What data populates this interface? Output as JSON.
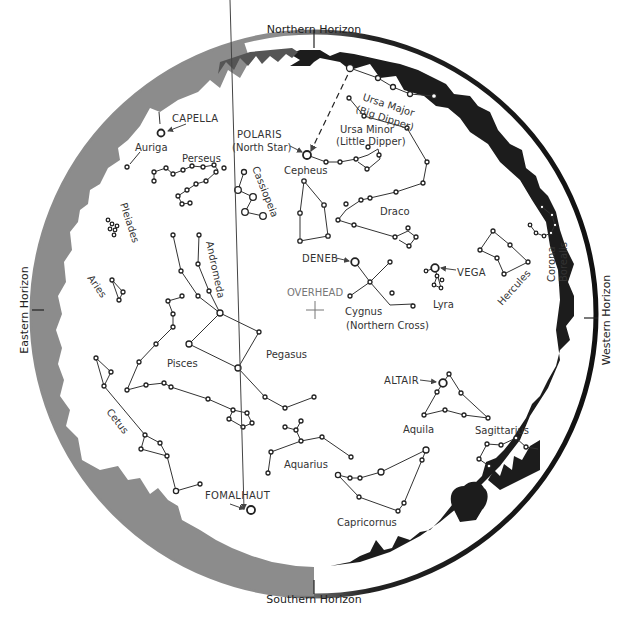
{
  "horizons": {
    "north": "Northern Horizon",
    "south": "Southern Horizon",
    "east": "Eastern Horizon",
    "west": "Western Horizon"
  },
  "center_label": "OVERHEAD",
  "bright_stars": {
    "capella": "CAPELLA",
    "polaris": "POLARIS",
    "polaris_sub": "(North Star)",
    "deneb": "DENEB",
    "vega": "VEGA",
    "altair": "ALTAIR",
    "fomalhaut": "FOMALHAUT"
  },
  "constellations": {
    "auriga": "Auriga",
    "perseus": "Perseus",
    "cassiopeia": "Cassiopeia",
    "cepheus": "Cepheus",
    "ursa_major": "Ursa Major",
    "ursa_major_sub": "(Big Dipper)",
    "ursa_minor": "Ursa Minor",
    "ursa_minor_sub": "(Little Dipper)",
    "draco": "Draco",
    "pleiades": "Pleiades",
    "andromeda": "Andromeda",
    "aries": "Aries",
    "cygnus": "Cygnus",
    "cygnus_sub": "(Northern Cross)",
    "lyra": "Lyra",
    "hercules": "Hercules",
    "corona_borealis_1": "Corona",
    "corona_borealis_2": "Borealis",
    "pisces": "Pisces",
    "pegasus": "Pegasus",
    "cetus": "Cetus",
    "aquila": "Aquila",
    "sagittarius": "Sagittarius",
    "aquarius": "Aquarius",
    "capricornus": "Capricornus"
  },
  "colors": {
    "east_horizon": "#8c8c8c",
    "west_horizon": "#1a1a1a",
    "outline": "#222222"
  }
}
